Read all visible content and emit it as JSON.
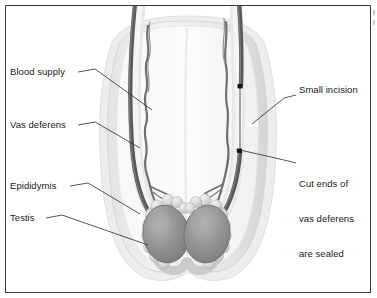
{
  "figure": {
    "frame_border_color": "#3a3a3a",
    "background_color": "#ffffff"
  },
  "labels": {
    "left": [
      {
        "id": "blood-supply",
        "text": "Blood supply"
      },
      {
        "id": "vas-deferens",
        "text": "Vas deferens"
      },
      {
        "id": "epididymis",
        "text": "Epididymis"
      },
      {
        "id": "testis",
        "text": "Testis"
      }
    ],
    "right": [
      {
        "id": "small-incision",
        "text": "Small incision"
      },
      {
        "id": "cut-ends-line1",
        "text": "Cut ends of"
      },
      {
        "id": "cut-ends-line2",
        "text": "vas deferens"
      },
      {
        "id": "cut-ends-line3",
        "text": "are sealed"
      }
    ]
  },
  "anatomy": {
    "scrotum_outer_color": "#eceded",
    "scrotum_wall_color": "#dcdedd",
    "scrotum_inner_color": "#f4f5f5",
    "testis_color": "#8d8d8d",
    "testis_highlight_color": "#b2b2b2",
    "epididymis_bead_color": "#d6d6d6",
    "vas_deferens_color": "#5e5f62",
    "blood_vessel_color": "#6f7073",
    "cut_end_marker_color": "#111111",
    "incision_color": "#ffffff",
    "leader_line_color": "#2b2b2b"
  },
  "icon_names": {
    "cut_end_marker": "cut-end-marker-icon",
    "incision_notch": "incision-notch-icon"
  }
}
